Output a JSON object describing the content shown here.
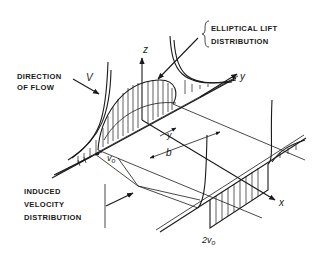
{
  "figure": {
    "labels": {
      "lift_line1": "ELLIPTICAL LIFT",
      "lift_line2": "DISTRIBUTION",
      "flow_line1": "DIRECTION",
      "flow_line2": "OF FLOW",
      "induced_line1": "INDUCED",
      "induced_line2": "VELOCITY",
      "induced_line3": "DISTRIBUTION"
    },
    "symbols": {
      "z_axis": "z",
      "y_axis": "y",
      "x_axis": "x",
      "freestream": "V",
      "v0": "v",
      "v0_sub": "o",
      "two_v0": "2v",
      "two_v0_sub": "o",
      "span": "b",
      "y_coord": "y"
    },
    "colors": {
      "ink": "#1a1a1a",
      "background": "#ffffff"
    }
  }
}
